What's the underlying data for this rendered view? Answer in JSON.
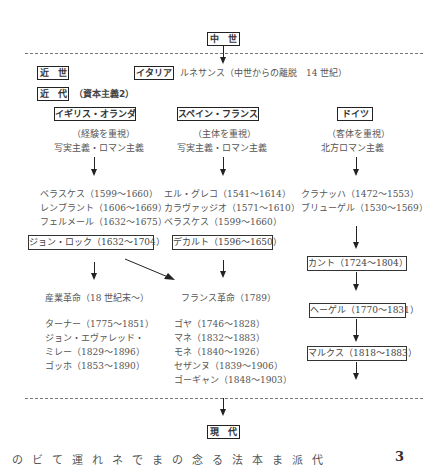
{
  "periods": {
    "medieval": "中　世",
    "early_modern": "近　世",
    "modern": "近　代",
    "modern_note": "（資本主義2）",
    "contemporary": "現　代"
  },
  "italy": {
    "label": "イタリア",
    "note": "ルネサンス（中世からの離脱　14 世紀）"
  },
  "columns": [
    {
      "header": "イギリス・オランダ",
      "emphasis": "（経験を重視）",
      "movement": "写実主義・ロマン主義",
      "artists": [
        "ベラスケス（1599～1660）",
        "レンブラント（1606～1669）",
        "フェルメール（1632～1675）"
      ],
      "philosopher": "ジョン・ロック（1632～1704）",
      "event": "産業革命（18 世紀末～）",
      "later_artists": [
        "ターナー（1775～1851）",
        "ジョン・エヴァレッド・",
        "ミレー（1829～1896）",
        "ゴッホ（1853～1890）"
      ]
    },
    {
      "header": "スペイン・フランス",
      "emphasis": "（主体を重視）",
      "movement": "写実主義・ロマン主義",
      "artists": [
        "エル・グレコ（1541～1614）",
        "カラヴァッジオ（1571～1610）",
        "ベラスケス（1599～1660）"
      ],
      "philosopher": "デカルト（1596～1650）",
      "event": "フランス革命（1789）",
      "later_artists": [
        "ゴヤ（1746～1828）",
        "マネ（1832～1883）",
        "モネ（1840～1926）",
        "セザンヌ（1839～1906）",
        "ゴーギャン（1848～1903）"
      ]
    },
    {
      "header": "ドイツ",
      "emphasis": "（客体を重視）",
      "movement": "北方ロマン主義",
      "artists": [
        "クラナッハ（1472～1553）",
        "ブリューゲル（1530～1569）"
      ],
      "philosophers": [
        "カント（1724～1804）",
        "ヘーゲル（1770～1831）",
        "マルクス（1818～1883）"
      ]
    }
  ],
  "footer": {
    "text": "のビて運れネでまの念る法本ま派代",
    "page_number": "3"
  }
}
